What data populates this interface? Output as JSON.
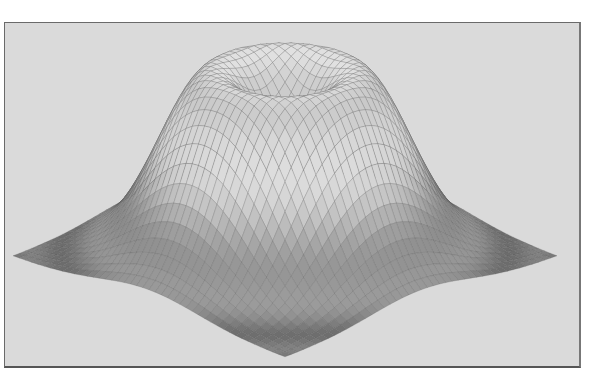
{
  "chart_data": {
    "type": "surface3d",
    "title": "",
    "xlabel": "",
    "ylabel": "",
    "zlabel": "",
    "domain": {
      "x": [
        -1,
        1
      ],
      "y": [
        -1,
        1
      ]
    },
    "grid": {
      "nx": 44,
      "ny": 44
    },
    "surface": {
      "profile": "ring-gaussian",
      "ring_radius": 0.38,
      "inner_width": 0.49,
      "outer_width": 0.4,
      "peak_height": 1.0,
      "center_height": 0.55,
      "band_frequency": 19
    },
    "projection": {
      "center_x": 285,
      "center_y": 256,
      "x_scale": 136,
      "y_scale": 50.5,
      "z_scale": 185
    },
    "corners_screen": {
      "left": [
        13,
        256
      ],
      "right": [
        557,
        256
      ],
      "front": [
        284,
        357
      ]
    },
    "axes_visible": false,
    "legend": null,
    "colors": {
      "background": "#dadada",
      "frame": "#6a6a6a",
      "surface_light": "#e2e2e2",
      "surface_dark": "#4a4a4a",
      "grid_line": "#5a5a5a"
    }
  }
}
